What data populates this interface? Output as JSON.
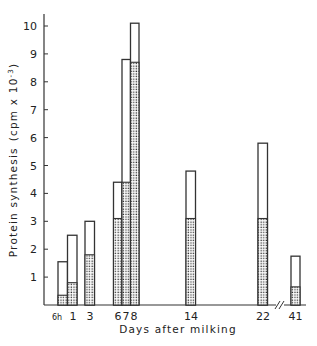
{
  "chart_data": {
    "type": "bar",
    "stacked_overlay": true,
    "title": "",
    "xlabel": "Days after milking",
    "ylabel": "Protein synthesis (cpm x 10^-3)",
    "ylabel_main": "Protein synthesis",
    "ylabel_units": "(cpm x 10",
    "ylabel_exp": "-3",
    "ylim": [
      0,
      10
    ],
    "yticks": [
      "1",
      "2",
      "3",
      "4",
      "5",
      "6",
      "7",
      "8",
      "9",
      "10"
    ],
    "categories": [
      "6h",
      "1",
      "3",
      "6",
      "7",
      "8",
      "14",
      "22",
      "41"
    ],
    "series": [
      {
        "name": "total (open bar)",
        "values": [
          1.55,
          2.5,
          3.0,
          4.4,
          8.8,
          10.1,
          4.8,
          5.8,
          1.75
        ]
      },
      {
        "name": "dotted portion",
        "values": [
          0.35,
          0.8,
          1.8,
          3.1,
          4.4,
          8.7,
          3.1,
          3.1,
          0.65
        ]
      }
    ],
    "axis_break": "between 22 and 41",
    "grid": false,
    "legend": "none"
  }
}
